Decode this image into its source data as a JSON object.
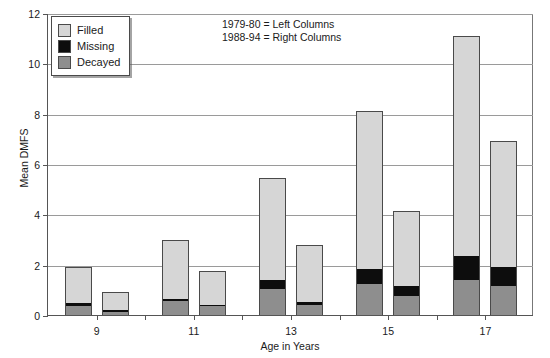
{
  "chart_data": {
    "type": "bar",
    "title": "",
    "subtitle": "",
    "xlabel": "Age in Years",
    "ylabel": "Mean DMFS",
    "ylim": [
      0,
      12
    ],
    "ytick_values": [
      0,
      2,
      4,
      6,
      8,
      10,
      12
    ],
    "ytick_labels": [
      "0",
      "2",
      "4",
      "6",
      "8",
      "10",
      "12"
    ],
    "xtick_labels": [
      "9",
      "11",
      "13",
      "15",
      "17"
    ],
    "categories": [
      "9",
      "11",
      "13",
      "15",
      "17"
    ],
    "grid": "horizontal",
    "legend_position": "top-left",
    "stacked": true,
    "grouped": true,
    "group_names": [
      "1979-80",
      "1988-94"
    ],
    "segment_order": [
      "Decayed",
      "Missing",
      "Filled"
    ],
    "series": [
      {
        "name": "Decayed",
        "color": "#8e8e8e",
        "values_left": [
          0.35,
          0.55,
          1.05,
          1.25,
          1.4
        ],
        "values_right": [
          0.12,
          0.35,
          0.4,
          0.75,
          1.15
        ]
      },
      {
        "name": "Missing",
        "color": "#0d0d0d",
        "values_left": [
          0.15,
          0.1,
          0.35,
          0.6,
          0.95
        ],
        "values_right": [
          0.08,
          0.05,
          0.12,
          0.4,
          0.75
        ]
      },
      {
        "name": "Filled",
        "color": "#d6d6d6",
        "values_left": [
          1.4,
          2.35,
          4.05,
          6.25,
          8.75
        ],
        "values_right": [
          0.7,
          1.35,
          2.28,
          3.0,
          5.0
        ]
      }
    ],
    "totals_left": [
      1.9,
      3.0,
      5.45,
      8.1,
      11.1
    ],
    "totals_right": [
      0.9,
      1.75,
      2.8,
      4.15,
      6.9
    ],
    "annotations": [
      "1979-80 = Left Columns",
      "1988-94 = Right Columns"
    ]
  },
  "legend": {
    "items": [
      {
        "label": "Filled",
        "key": "filled"
      },
      {
        "label": "Missing",
        "key": "missing"
      },
      {
        "label": "Decayed",
        "key": "decayed"
      }
    ]
  },
  "axes": {
    "y_title": "Mean DMFS",
    "x_title": "Age in Years"
  }
}
